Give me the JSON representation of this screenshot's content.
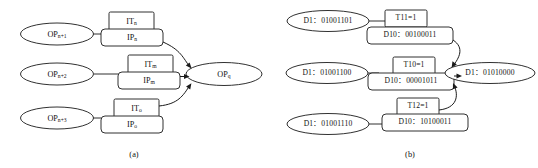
{
  "figure": {
    "panels": [
      {
        "id": "panel-a",
        "caption": "(a)",
        "rows": [
          {
            "source_label_base": "OP",
            "source_label_sub": "n+1",
            "top_box_base": "IT",
            "top_box_sub": "n",
            "bottom_box_base": "IP",
            "bottom_box_sub": "n"
          },
          {
            "source_label_base": "OP",
            "source_label_sub": "n+2",
            "top_box_base": "IT",
            "top_box_sub": "m",
            "bottom_box_base": "IP",
            "bottom_box_sub": "m"
          },
          {
            "source_label_base": "OP",
            "source_label_sub": "n+3",
            "top_box_base": "IT",
            "top_box_sub": "o",
            "bottom_box_base": "IP",
            "bottom_box_sub": "o"
          }
        ],
        "target_label_base": "OP",
        "target_label_sub": "q"
      },
      {
        "id": "panel-b",
        "caption": "(b)",
        "rows": [
          {
            "source_label": "D1：01001101",
            "top_box": "T11=1",
            "bottom_box": "D10：00100011"
          },
          {
            "source_label": "D1：01001100",
            "top_box": "T10=1",
            "bottom_box": "D10：00001011"
          },
          {
            "source_label": "D1：01001110",
            "top_box": "T12=1",
            "bottom_box": "D10：10100011"
          }
        ],
        "target_label": "D1：01010000"
      }
    ],
    "colors": {
      "stroke": "#1a1a1a",
      "text": "#111111",
      "background": "#ffffff"
    }
  }
}
